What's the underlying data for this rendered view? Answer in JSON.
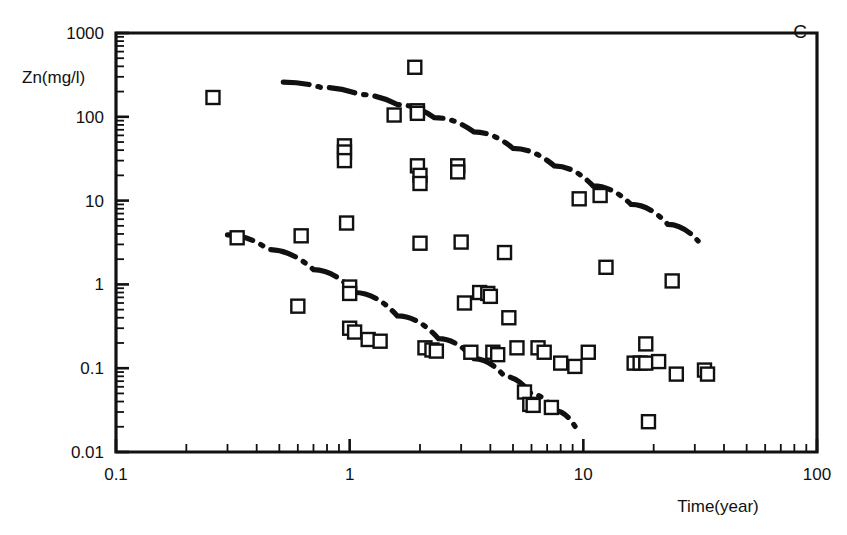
{
  "figure": {
    "panel_label": "C",
    "marker_style": "open-square",
    "line_style": "dash-dot",
    "ink_color": "#111111",
    "background_color": "#ffffff"
  },
  "chart_data": {
    "type": "scatter",
    "title": "",
    "subtitle": "",
    "panel": "C",
    "xlabel": "Time(year)",
    "ylabel": "Zn(mg/l)",
    "xscale": "log",
    "yscale": "log",
    "xlim": [
      0.1,
      100
    ],
    "ylim": [
      0.01,
      1000
    ],
    "grid": false,
    "legend": null,
    "xticks": [
      0.1,
      1,
      10,
      100
    ],
    "xtick_labels": [
      "0.1",
      "1",
      "10",
      "100"
    ],
    "yticks": [
      0.01,
      0.1,
      1,
      10,
      100,
      1000
    ],
    "ytick_labels": [
      "0.01",
      "0.1",
      "1",
      "10",
      "100",
      "1000"
    ],
    "minor_ticks": true,
    "series": [
      {
        "name": "Zn concentration observations",
        "marker": "open-square",
        "points": [
          [
            0.26,
            170
          ],
          [
            0.33,
            3.6
          ],
          [
            0.6,
            0.55
          ],
          [
            0.62,
            3.8
          ],
          [
            0.95,
            45
          ],
          [
            0.95,
            38
          ],
          [
            0.95,
            30
          ],
          [
            0.97,
            5.4
          ],
          [
            1.0,
            0.93
          ],
          [
            1.0,
            0.78
          ],
          [
            1.0,
            0.3
          ],
          [
            1.05,
            0.27
          ],
          [
            1.2,
            0.22
          ],
          [
            1.35,
            0.21
          ],
          [
            1.55,
            105
          ],
          [
            1.9,
            390
          ],
          [
            1.95,
            118
          ],
          [
            1.95,
            110
          ],
          [
            1.95,
            26
          ],
          [
            2.0,
            20
          ],
          [
            2.0,
            16
          ],
          [
            2.0,
            3.1
          ],
          [
            2.1,
            0.175
          ],
          [
            2.25,
            0.165
          ],
          [
            2.35,
            0.16
          ],
          [
            2.9,
            26
          ],
          [
            2.9,
            22
          ],
          [
            3.0,
            3.2
          ],
          [
            3.1,
            0.6
          ],
          [
            3.3,
            0.155
          ],
          [
            3.6,
            0.8
          ],
          [
            3.9,
            0.78
          ],
          [
            4.0,
            0.72
          ],
          [
            4.1,
            0.155
          ],
          [
            4.3,
            0.145
          ],
          [
            4.6,
            2.4
          ],
          [
            4.8,
            0.4
          ],
          [
            5.2,
            0.175
          ],
          [
            5.6,
            0.052
          ],
          [
            5.9,
            0.037
          ],
          [
            6.1,
            0.036
          ],
          [
            6.4,
            0.175
          ],
          [
            6.8,
            0.155
          ],
          [
            7.3,
            0.034
          ],
          [
            8.0,
            0.115
          ],
          [
            9.2,
            0.105
          ],
          [
            9.6,
            10.5
          ],
          [
            10.5,
            0.155
          ],
          [
            11.8,
            11.5
          ],
          [
            12.5,
            1.6
          ],
          [
            16.5,
            0.115
          ],
          [
            17.5,
            0.115
          ],
          [
            18.5,
            0.115
          ],
          [
            18.5,
            0.195
          ],
          [
            19.0,
            0.023
          ],
          [
            21.0,
            0.12
          ],
          [
            24.0,
            1.1
          ],
          [
            25.0,
            0.085
          ],
          [
            33.0,
            0.095
          ],
          [
            34.0,
            0.085
          ]
        ]
      }
    ],
    "trend_lines": [
      {
        "name": "upper envelope",
        "style": "dash-dot",
        "points": [
          [
            0.52,
            260
          ],
          [
            0.75,
            225
          ],
          [
            1.1,
            185
          ],
          [
            1.6,
            140
          ],
          [
            2.3,
            98
          ],
          [
            3.4,
            66
          ],
          [
            5.0,
            42
          ],
          [
            7.5,
            26
          ],
          [
            11.0,
            15
          ],
          [
            16.0,
            9.0
          ],
          [
            23.0,
            5.2
          ],
          [
            31.0,
            3.3
          ]
        ]
      },
      {
        "name": "lower envelope",
        "style": "dash-dot",
        "points": [
          [
            0.3,
            3.9
          ],
          [
            0.45,
            2.6
          ],
          [
            0.7,
            1.5
          ],
          [
            1.05,
            0.8
          ],
          [
            1.6,
            0.42
          ],
          [
            2.4,
            0.225
          ],
          [
            3.4,
            0.13
          ],
          [
            4.6,
            0.08
          ],
          [
            6.0,
            0.049
          ],
          [
            7.6,
            0.031
          ],
          [
            9.5,
            0.0175
          ]
        ]
      }
    ]
  }
}
